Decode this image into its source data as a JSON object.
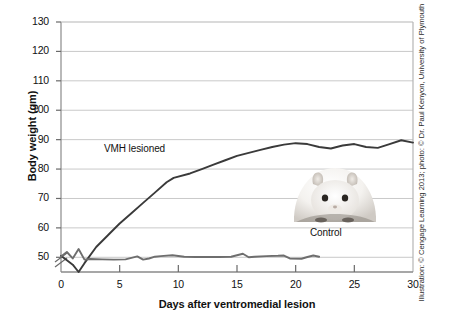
{
  "chart_data": {
    "type": "line",
    "title": "",
    "xlabel": "Days after ventromedial lesion",
    "ylabel": "Body weight (gm)",
    "xlim": [
      0,
      30
    ],
    "ylim": [
      45,
      130
    ],
    "y_axis_break": true,
    "y_break_note": "axis broken below 50",
    "grid": "horizontal",
    "legend_position": "inline-annotations",
    "xticks": [
      "0",
      "5",
      "10",
      "15",
      "20",
      "25",
      "30"
    ],
    "xtick_values": [
      0,
      5,
      10,
      15,
      20,
      25,
      30
    ],
    "yticks": [
      "50",
      "60",
      "70",
      "80",
      "90",
      "100",
      "110",
      "120",
      "130"
    ],
    "ytick_values": [
      50,
      60,
      70,
      80,
      90,
      100,
      110,
      120,
      130
    ],
    "series": [
      {
        "name": "VMH lesioned",
        "color": "#3a3a3a",
        "x": [
          0,
          0.5,
          1.0,
          1.5,
          2.0,
          3.0,
          4.0,
          5.0,
          6.0,
          7.0,
          8.0,
          9.0,
          9.6,
          11.0,
          12.0,
          13.0,
          14.0,
          15.0,
          16.0,
          17.0,
          18.0,
          19.0,
          20.0,
          21.0,
          22.0,
          23.0,
          24.0,
          25.0,
          26.0,
          27.0,
          28.0,
          29.0,
          30.0
        ],
        "values": [
          50.5,
          49.0,
          47.5,
          45.0,
          48.0,
          53.5,
          57.5,
          61.5,
          65.0,
          68.5,
          72.0,
          75.5,
          77.0,
          78.5,
          80.0,
          81.5,
          83.0,
          84.5,
          85.5,
          86.5,
          87.5,
          88.3,
          88.8,
          88.5,
          87.5,
          87.0,
          88.0,
          88.5,
          87.5,
          87.2,
          88.5,
          89.8,
          89.0
        ]
      },
      {
        "name": "Control",
        "color": "#6e6e6e",
        "x": [
          0,
          0.5,
          1.0,
          1.5,
          2.0,
          2.5,
          3.5,
          4.5,
          5.5,
          6.5,
          7.0,
          7.5,
          8.0,
          8.5,
          9.5,
          10.5,
          11.5,
          12.5,
          13.5,
          14.5,
          15.5,
          16.0,
          16.5,
          17.5,
          18.5,
          19.0,
          19.5,
          20.5,
          21.0,
          21.5,
          22.0
        ],
        "values": [
          50.3,
          51.8,
          49.6,
          52.8,
          49.2,
          49.4,
          49.3,
          49.2,
          49.3,
          50.3,
          49.2,
          49.6,
          50.2,
          50.4,
          50.7,
          50.2,
          50.1,
          50.1,
          50.1,
          50.2,
          51.2,
          50.0,
          50.2,
          50.4,
          50.5,
          50.6,
          49.6,
          49.5,
          50.1,
          50.6,
          50.2
        ]
      }
    ],
    "annotations": [
      {
        "text": "VMH lesioned",
        "x": 7.6,
        "y": 93
      },
      {
        "text": "Control",
        "x": 22.9,
        "y": 56
      }
    ]
  },
  "credit": "Illustration: © Cengage Learning 2013; photo: © Dr. Paul Kenyon, University of Plymouth",
  "photo": {
    "subject": "obese-hamster-photo",
    "alt": "White obese hamster"
  }
}
